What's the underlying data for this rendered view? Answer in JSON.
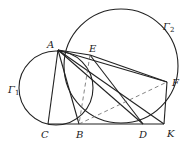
{
  "diagram": {
    "stroke_color": "#222222",
    "dashed_color": "#666666",
    "circles": [
      {
        "name": "Gamma1",
        "label": "Γ",
        "sub": "1",
        "cx": 56,
        "cy": 88,
        "r": 37,
        "label_x": 8,
        "label_y": 93
      },
      {
        "name": "Gamma2",
        "label": "Γ",
        "sub": "2",
        "cx": 121,
        "cy": 66,
        "r": 57,
        "label_x": 163,
        "label_y": 30
      }
    ],
    "points": {
      "A": {
        "label": "A",
        "x": 58,
        "y": 50,
        "lx": 47,
        "ly": 48
      },
      "E": {
        "label": "E",
        "x": 90,
        "y": 55,
        "lx": 89,
        "ly": 52
      },
      "F": {
        "label": "F",
        "x": 167,
        "y": 82,
        "lx": 172,
        "ly": 86
      },
      "C": {
        "label": "C",
        "x": 48,
        "y": 124,
        "lx": 41,
        "ly": 138
      },
      "B": {
        "label": "B",
        "x": 79,
        "y": 124,
        "lx": 76,
        "ly": 138
      },
      "D": {
        "label": "D",
        "x": 143,
        "y": 124,
        "lx": 139,
        "ly": 138
      },
      "K": {
        "label": "K",
        "x": 164,
        "y": 124,
        "lx": 167,
        "ly": 137
      }
    },
    "solid_segments": [
      [
        "A",
        "C"
      ],
      [
        "A",
        "B"
      ],
      [
        "A",
        "E"
      ],
      [
        "A",
        "F"
      ],
      [
        "A",
        "D"
      ],
      [
        "A",
        "K"
      ],
      [
        "C",
        "K"
      ],
      [
        "E",
        "D"
      ],
      [
        "F",
        "K"
      ],
      [
        "E",
        "F"
      ]
    ],
    "dashed_segments": [
      [
        "E",
        "B"
      ],
      [
        "B",
        "F"
      ]
    ]
  }
}
